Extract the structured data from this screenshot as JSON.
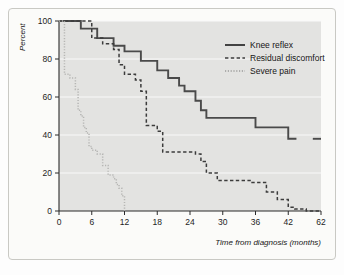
{
  "chart_data": {
    "type": "line",
    "subtype": "kaplan-meier-step",
    "title": "",
    "xlabel": "Time from diagnosis (months)",
    "ylabel": "Percent",
    "xlim": [
      0,
      62
    ],
    "ylim": [
      0,
      100
    ],
    "xticks": [
      0,
      6,
      12,
      18,
      24,
      30,
      36,
      42,
      62
    ],
    "xticklabels": [
      "0",
      "6",
      "12",
      "18",
      "24",
      "30",
      "36",
      "42",
      "62"
    ],
    "yticks": [
      0,
      20,
      40,
      60,
      80,
      100
    ],
    "yticklabels": [
      "0",
      "20",
      "40",
      "60",
      "80",
      "100"
    ],
    "grid": "horizontal",
    "plot_background": "#e3e3e1",
    "legend_position": "top-right",
    "series": [
      {
        "name": "Knee reflex",
        "style": "solid",
        "color": "#4a4a4a",
        "points": [
          [
            0,
            100
          ],
          [
            4,
            100
          ],
          [
            4,
            96
          ],
          [
            7,
            96
          ],
          [
            7,
            91
          ],
          [
            10,
            91
          ],
          [
            10,
            87
          ],
          [
            12,
            87
          ],
          [
            12,
            84
          ],
          [
            15,
            84
          ],
          [
            15,
            79
          ],
          [
            18,
            79
          ],
          [
            18,
            74
          ],
          [
            20,
            74
          ],
          [
            20,
            70
          ],
          [
            22,
            70
          ],
          [
            22,
            66
          ],
          [
            23,
            66
          ],
          [
            23,
            63
          ],
          [
            25,
            63
          ],
          [
            25,
            58
          ],
          [
            26,
            58
          ],
          [
            26,
            53
          ],
          [
            27,
            53
          ],
          [
            27,
            49
          ],
          [
            36,
            49
          ],
          [
            36,
            44
          ],
          [
            42,
            44
          ],
          [
            42,
            38
          ],
          [
            47,
            38
          ]
        ],
        "tail_segment": [
          [
            57,
            38
          ],
          [
            62,
            38
          ]
        ]
      },
      {
        "name": "Residual discomfort",
        "style": "dashed",
        "color": "#3c3c3c",
        "points": [
          [
            0,
            100
          ],
          [
            6,
            100
          ],
          [
            6,
            91
          ],
          [
            8,
            91
          ],
          [
            8,
            88
          ],
          [
            10,
            88
          ],
          [
            10,
            85
          ],
          [
            11,
            85
          ],
          [
            11,
            77
          ],
          [
            12,
            77
          ],
          [
            12,
            72
          ],
          [
            14,
            72
          ],
          [
            14,
            69
          ],
          [
            15,
            69
          ],
          [
            15,
            63
          ],
          [
            16,
            63
          ],
          [
            16,
            45
          ],
          [
            18,
            45
          ],
          [
            18,
            42
          ],
          [
            19,
            42
          ],
          [
            19,
            31
          ],
          [
            25,
            31
          ],
          [
            25,
            30
          ],
          [
            26,
            30
          ],
          [
            26,
            26
          ],
          [
            27,
            26
          ],
          [
            27,
            20
          ],
          [
            29,
            20
          ],
          [
            29,
            16
          ],
          [
            35,
            16
          ],
          [
            35,
            15
          ],
          [
            38,
            15
          ],
          [
            38,
            10
          ],
          [
            40,
            10
          ],
          [
            40,
            6
          ],
          [
            42,
            6
          ],
          [
            42,
            2
          ],
          [
            46,
            2
          ],
          [
            46,
            1
          ],
          [
            53,
            1
          ],
          [
            53,
            0
          ],
          [
            62,
            0
          ]
        ]
      },
      {
        "name": "Severe pain",
        "style": "dotted",
        "color": "#b6b6b4",
        "points": [
          [
            0,
            100
          ],
          [
            1,
            100
          ],
          [
            1,
            72
          ],
          [
            2,
            72
          ],
          [
            2,
            70
          ],
          [
            3,
            70
          ],
          [
            3,
            64
          ],
          [
            3.5,
            64
          ],
          [
            3.5,
            53
          ],
          [
            4,
            53
          ],
          [
            4,
            50
          ],
          [
            4.5,
            50
          ],
          [
            4.5,
            44
          ],
          [
            5,
            44
          ],
          [
            5,
            41
          ],
          [
            5.5,
            41
          ],
          [
            5.5,
            34
          ],
          [
            6,
            34
          ],
          [
            6,
            32
          ],
          [
            7,
            32
          ],
          [
            7,
            30
          ],
          [
            8,
            30
          ],
          [
            8,
            24
          ],
          [
            9,
            24
          ],
          [
            9,
            19
          ],
          [
            10,
            19
          ],
          [
            10,
            17
          ],
          [
            10.5,
            17
          ],
          [
            10.5,
            14
          ],
          [
            11,
            14
          ],
          [
            11,
            12
          ],
          [
            11.5,
            12
          ],
          [
            11.5,
            8
          ],
          [
            12,
            8
          ],
          [
            12,
            0
          ]
        ]
      }
    ]
  },
  "legend": {
    "items": [
      {
        "label": "Knee reflex",
        "style": "solid"
      },
      {
        "label": "Residual discomfort",
        "style": "dashed"
      },
      {
        "label": "Severe pain",
        "style": "dotted"
      }
    ]
  }
}
